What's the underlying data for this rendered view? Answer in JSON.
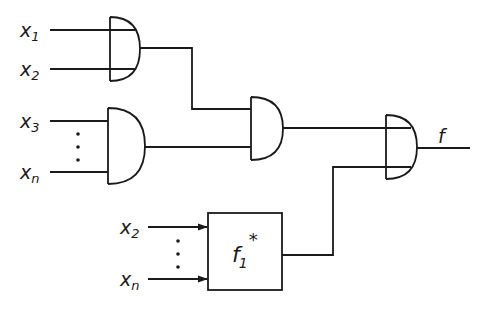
{
  "diagram": {
    "type": "logic-circuit",
    "gates": [
      {
        "id": "and1",
        "kind": "AND",
        "inputs": [
          "x1",
          "x2"
        ]
      },
      {
        "id": "and2",
        "kind": "AND",
        "inputs": [
          "x3",
          "...",
          "xn"
        ]
      },
      {
        "id": "and3",
        "kind": "AND",
        "inputs": [
          "and1",
          "and2"
        ]
      },
      {
        "id": "and4",
        "kind": "AND",
        "inputs": [
          "and3",
          "f1*"
        ],
        "output": "f"
      }
    ],
    "block": {
      "id": "f1star",
      "label_base": "f",
      "label_sub": "1",
      "label_sup": "*",
      "inputs": [
        "x2",
        "...",
        "xn"
      ]
    },
    "labels": {
      "x1": {
        "base": "x",
        "sub": "1"
      },
      "x2": {
        "base": "x",
        "sub": "2"
      },
      "x3": {
        "base": "x",
        "sub": "3"
      },
      "xn": {
        "base": "x",
        "sub": "n"
      },
      "x2b": {
        "base": "x",
        "sub": "2"
      },
      "xnb": {
        "base": "x",
        "sub": "n"
      },
      "output": "f"
    },
    "ellipsis": "⋮"
  }
}
